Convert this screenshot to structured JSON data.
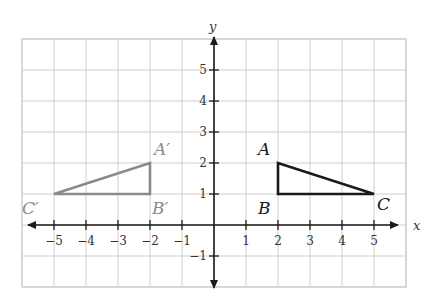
{
  "diagram": {
    "type": "coordinate-plane",
    "axes": {
      "x_label": "x",
      "y_label": "y",
      "x_ticks": [
        "−5",
        "−4",
        "−3",
        "−2",
        "−1",
        "1",
        "2",
        "3",
        "4",
        "5"
      ],
      "x_tick_values": [
        -5,
        -4,
        -3,
        -2,
        -1,
        1,
        2,
        3,
        4,
        5
      ],
      "y_ticks": [
        "5",
        "4",
        "3",
        "2",
        "1",
        "−1"
      ],
      "y_tick_values": [
        5,
        4,
        3,
        2,
        1,
        -1
      ]
    },
    "grid": {
      "x_range": [
        -6,
        6
      ],
      "y_range": [
        -2,
        6
      ],
      "color": "#cfcfcf"
    },
    "triangles": [
      {
        "name": "ABC",
        "color": "#1a1a1a",
        "vertices": [
          {
            "label": "A",
            "x": 2,
            "y": 2
          },
          {
            "label": "B",
            "x": 2,
            "y": 1
          },
          {
            "label": "C",
            "x": 5,
            "y": 1
          }
        ]
      },
      {
        "name": "A′B′C′",
        "color": "#8a8a8a",
        "vertices": [
          {
            "label": "A′",
            "x": -2,
            "y": 2
          },
          {
            "label": "B′",
            "x": -2,
            "y": 1
          },
          {
            "label": "C′",
            "x": -5,
            "y": 1
          }
        ]
      }
    ]
  }
}
